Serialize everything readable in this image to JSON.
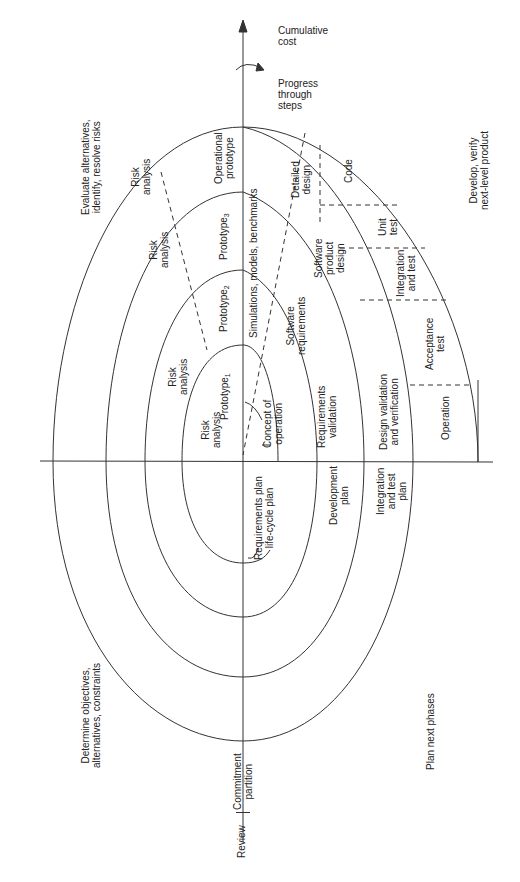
{
  "diagram": {
    "type": "spiral-model",
    "axes": {
      "vertical_top": "Cumulative\ncost",
      "rotation_note": "Progress\nthrough\nsteps",
      "bottom_left": "Review",
      "bottom_center": "Commitment\npartition"
    },
    "quadrants": {
      "evaluate": "Evaluate alternatives,\nidentify, resolve risks",
      "develop": "Develop, verify\nnext-level product",
      "determine": "Determine objectives,\nalternatives, constraints",
      "plan": "Plan next phases"
    },
    "evaluate_quadrant": {
      "risk_analysis_1": "Risk\nanalysis",
      "risk_analysis_2": "Risk\nanalysis",
      "risk_analysis_3": "Risk\nanalysis",
      "risk_analysis_4": "Risk\nanalysis",
      "prototype_1": "Prototype",
      "prototype_1_sub": "1",
      "prototype_2": "Prototype",
      "prototype_2_sub": "2",
      "prototype_3": "Prototype",
      "prototype_3_sub": "3",
      "operational_prototype": "Operational\nprototype"
    },
    "develop_quadrant": {
      "simulations": "Simulations, models, benchmarks",
      "concept_of_operation": "Concept of\noperation",
      "software_requirements": "Software\nrequirements",
      "requirements_validation": "Requirements\nvalidation",
      "software_product_design": "Software\nproduct\ndesign",
      "design_validation": "Design validation\nand verification",
      "detailed_design": "Detailed\ndesign",
      "code": "Code",
      "unit_test": "Unit\ntest",
      "integration_and_test": "Integration\nand test",
      "acceptance_test": "Acceptance\ntest",
      "operation": "Operation"
    },
    "plan_quadrant": {
      "requirements_plan": "Requirements plan\nlife-cycle plan",
      "development_plan": "Development\nplan",
      "integration_test_plan": "Integration\nand test\nplan"
    },
    "colors": {
      "line": "#333333",
      "text": "#222222",
      "background": "#ffffff"
    }
  }
}
